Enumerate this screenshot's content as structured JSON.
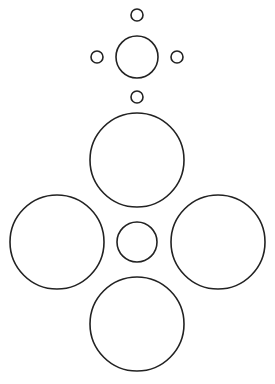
{
  "canvas": {
    "width": 275,
    "height": 384,
    "background": "#ffffff",
    "stroke_color": "#222222",
    "stroke_width": 1.6
  },
  "diagram": {
    "top_cluster": {
      "center": {
        "name": "top-center-circle",
        "cx": 137,
        "cy": 57,
        "r": 21
      },
      "satellites": [
        {
          "name": "top-satellite-north",
          "cx": 137,
          "cy": 15,
          "r": 6
        },
        {
          "name": "top-satellite-west",
          "cx": 97,
          "cy": 57,
          "r": 6
        },
        {
          "name": "top-satellite-east",
          "cx": 177,
          "cy": 57,
          "r": 6
        },
        {
          "name": "top-satellite-south",
          "cx": 137,
          "cy": 97,
          "r": 6
        }
      ]
    },
    "bottom_cluster": {
      "center": {
        "name": "bottom-center-circle",
        "cx": 137,
        "cy": 242,
        "r": 20
      },
      "satellites": [
        {
          "name": "bottom-satellite-north",
          "cx": 137,
          "cy": 160,
          "r": 47
        },
        {
          "name": "bottom-satellite-west",
          "cx": 57,
          "cy": 242,
          "r": 47
        },
        {
          "name": "bottom-satellite-east",
          "cx": 218,
          "cy": 242,
          "r": 47
        },
        {
          "name": "bottom-satellite-south",
          "cx": 137,
          "cy": 324,
          "r": 47
        }
      ]
    }
  }
}
